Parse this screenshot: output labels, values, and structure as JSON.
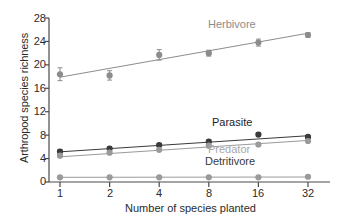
{
  "chart_data": {
    "type": "scatter",
    "title": "",
    "xlabel": "Number of species planted",
    "ylabel": "Arthropod species richness",
    "x": [
      1,
      2,
      4,
      8,
      16,
      32
    ],
    "categories": [
      "1",
      "2",
      "4",
      "8",
      "16",
      "32"
    ],
    "x_scale": "log2",
    "xlim": [
      1,
      32
    ],
    "ylim": [
      0,
      28
    ],
    "yticks": [
      0,
      4,
      8,
      12,
      16,
      20,
      24,
      28
    ],
    "ytick_labels": [
      "0",
      "4",
      "8",
      "12",
      "16",
      "20",
      "24",
      "28"
    ],
    "grid": false,
    "legend_position": "inline-annotations",
    "series": [
      {
        "name": "Herbivore",
        "color": "#8c8c8c",
        "marker": "circle",
        "values": [
          18.4,
          18.2,
          21.7,
          22.0,
          23.8,
          25.1
        ],
        "errors": [
          1.1,
          0.8,
          0.9,
          0.5,
          0.6,
          0.4
        ],
        "fit_line": {
          "y_start": 17.9,
          "y_end": 25.4
        }
      },
      {
        "name": "Parasite",
        "color": "#3a3a3a",
        "marker": "circle",
        "values": [
          5.2,
          5.7,
          6.3,
          6.9,
          8.1,
          7.7
        ],
        "errors": [
          0.3,
          0.3,
          0.25,
          0.25,
          0.3,
          0.25
        ],
        "fit_line": {
          "y_start": 5.15,
          "y_end": 7.9
        }
      },
      {
        "name": "Predator",
        "color": "#9a9a9a",
        "marker": "circle",
        "values": [
          4.5,
          5.0,
          5.5,
          6.2,
          6.4,
          7.0
        ],
        "errors": [
          0.25,
          0.25,
          0.2,
          0.2,
          0.25,
          0.2
        ],
        "fit_line": {
          "y_start": 4.3,
          "y_end": 7.1
        }
      },
      {
        "name": "Detritivore",
        "color": "#9a9a9a",
        "marker": "circle",
        "values": [
          0.8,
          0.8,
          0.8,
          0.8,
          0.8,
          0.9
        ],
        "errors": [
          0.15,
          0.15,
          0.15,
          0.15,
          0.15,
          0.15
        ],
        "fit_line": {
          "y_start": 0.8,
          "y_end": 0.85
        }
      }
    ],
    "annotations": [
      {
        "text": "Herbivore",
        "color": "#8c8c8c"
      },
      {
        "text": "Parasite",
        "color": "#1d1d1d"
      },
      {
        "text": "Predator",
        "color": "#a8a8a8"
      },
      {
        "text": "Detritivore",
        "color": "#3a3a3a"
      }
    ]
  },
  "axes": {
    "ylabel": "Arthropod species richness",
    "xlabel": "Number of species planted",
    "ytick_labels": [
      "28",
      "24",
      "20",
      "16",
      "12",
      "8",
      "4",
      "0"
    ],
    "xtick_labels": [
      "1",
      "2",
      "4",
      "8",
      "16",
      "32"
    ]
  },
  "annotations": {
    "herbivore": "Herbivore",
    "parasite": "Parasite",
    "predator": "Predator",
    "detritivore": "Detritivore"
  },
  "colors": {
    "herbivore": "#8c8c8c",
    "parasite": "#3a3a3a",
    "predator": "#9a9a9a",
    "detritivore": "#9a9a9a",
    "axis": "#4a4a4a",
    "text": "#2a2a2a"
  }
}
